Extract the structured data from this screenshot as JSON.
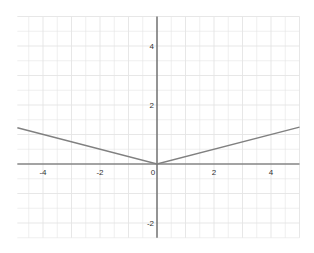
{
  "chart_data": {
    "type": "line",
    "title": "",
    "xlabel": "",
    "ylabel": "",
    "xlim": [
      -4.9,
      5.0
    ],
    "ylim": [
      -2.5,
      5.0
    ],
    "grid": true,
    "grid_step": 0.5,
    "x_ticks": [
      -4,
      -2,
      0,
      2,
      4
    ],
    "y_ticks": [
      -2,
      2,
      4
    ],
    "x_tick_labels": [
      "-4",
      "-2",
      "0",
      "2",
      "4"
    ],
    "y_tick_labels": [
      "-2",
      "2",
      "4"
    ],
    "series": [
      {
        "name": "y = |x| / 4",
        "color": "#808080",
        "x": [
          -4.9,
          0,
          5.0
        ],
        "y": [
          1.23,
          0,
          1.25
        ]
      }
    ]
  },
  "colors": {
    "axis": "#555555",
    "grid": "#e4e4e4",
    "line": "#808080"
  }
}
